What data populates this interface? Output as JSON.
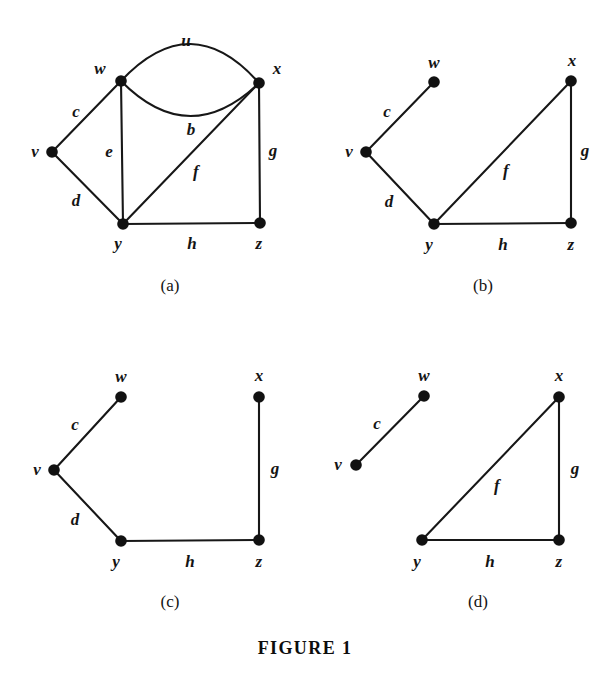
{
  "figure": {
    "caption": "FIGURE 1",
    "caption_pos": {
      "x": 305,
      "y": 648
    },
    "ink_color": "#141414",
    "background_color": "#ffffff"
  },
  "panels": [
    {
      "id": "panel-a",
      "label": "(a)",
      "label_pos": {
        "x": 170,
        "y": 286
      },
      "vertices": [
        {
          "id": "v",
          "label": "v",
          "x": 52,
          "y": 152,
          "label_x": 35,
          "label_y": 151
        },
        {
          "id": "w",
          "label": "w",
          "x": 121,
          "y": 81,
          "label_x": 100,
          "label_y": 68
        },
        {
          "id": "x",
          "label": "x",
          "x": 259,
          "y": 83,
          "label_x": 277,
          "label_y": 68
        },
        {
          "id": "y",
          "label": "y",
          "x": 123,
          "y": 224,
          "label_x": 118,
          "label_y": 243
        },
        {
          "id": "z",
          "label": "z",
          "x": 260,
          "y": 223,
          "label_x": 259,
          "label_y": 243
        }
      ],
      "edges": [
        {
          "id": "u",
          "label": "u",
          "from": "w",
          "to": "x",
          "shape": "arc",
          "bow": -38,
          "label_x": 186,
          "label_y": 40
        },
        {
          "id": "b",
          "label": "b",
          "from": "w",
          "to": "x",
          "shape": "arc",
          "bow": 34,
          "label_x": 191,
          "label_y": 129
        },
        {
          "id": "c",
          "label": "c",
          "from": "v",
          "to": "w",
          "shape": "line",
          "label_x": 76,
          "label_y": 111
        },
        {
          "id": "d",
          "label": "d",
          "from": "v",
          "to": "y",
          "shape": "line",
          "label_x": 76,
          "label_y": 200
        },
        {
          "id": "e",
          "label": "e",
          "from": "w",
          "to": "y",
          "shape": "line",
          "label_x": 109,
          "label_y": 151
        },
        {
          "id": "f",
          "label": "f",
          "from": "y",
          "to": "x",
          "shape": "line",
          "label_x": 196,
          "label_y": 171
        },
        {
          "id": "g",
          "label": "g",
          "from": "x",
          "to": "z",
          "shape": "line",
          "label_x": 273,
          "label_y": 150
        },
        {
          "id": "h",
          "label": "h",
          "from": "y",
          "to": "z",
          "shape": "line",
          "label_x": 192,
          "label_y": 243
        }
      ]
    },
    {
      "id": "panel-b",
      "label": "(b)",
      "label_pos": {
        "x": 483,
        "y": 286
      },
      "vertices": [
        {
          "id": "v",
          "label": "v",
          "x": 366,
          "y": 152,
          "label_x": 349,
          "label_y": 151
        },
        {
          "id": "w",
          "label": "w",
          "x": 434,
          "y": 82,
          "label_x": 434,
          "label_y": 62
        },
        {
          "id": "x",
          "label": "x",
          "x": 571,
          "y": 81,
          "label_x": 572,
          "label_y": 60
        },
        {
          "id": "y",
          "label": "y",
          "x": 434,
          "y": 224,
          "label_x": 429,
          "label_y": 244
        },
        {
          "id": "z",
          "label": "z",
          "x": 571,
          "y": 223,
          "label_x": 571,
          "label_y": 244
        }
      ],
      "edges": [
        {
          "id": "c",
          "label": "c",
          "from": "v",
          "to": "w",
          "shape": "line",
          "label_x": 387,
          "label_y": 111
        },
        {
          "id": "d",
          "label": "d",
          "from": "v",
          "to": "y",
          "shape": "line",
          "label_x": 389,
          "label_y": 201
        },
        {
          "id": "f",
          "label": "f",
          "from": "y",
          "to": "x",
          "shape": "line",
          "label_x": 506,
          "label_y": 170
        },
        {
          "id": "g",
          "label": "g",
          "from": "x",
          "to": "z",
          "shape": "line",
          "label_x": 585,
          "label_y": 150
        },
        {
          "id": "h",
          "label": "h",
          "from": "y",
          "to": "z",
          "shape": "line",
          "label_x": 503,
          "label_y": 244
        }
      ]
    },
    {
      "id": "panel-c",
      "label": "(c)",
      "label_pos": {
        "x": 170,
        "y": 602
      },
      "vertices": [
        {
          "id": "v",
          "label": "v",
          "x": 54,
          "y": 470,
          "label_x": 37,
          "label_y": 469
        },
        {
          "id": "w",
          "label": "w",
          "x": 121,
          "y": 397,
          "label_x": 121,
          "label_y": 376
        },
        {
          "id": "x",
          "label": "x",
          "x": 259,
          "y": 397,
          "label_x": 259,
          "label_y": 375
        },
        {
          "id": "y",
          "label": "y",
          "x": 121,
          "y": 541,
          "label_x": 116,
          "label_y": 561
        },
        {
          "id": "z",
          "label": "z",
          "x": 259,
          "y": 540,
          "label_x": 259,
          "label_y": 561
        }
      ],
      "edges": [
        {
          "id": "c",
          "label": "c",
          "from": "v",
          "to": "w",
          "shape": "line",
          "label_x": 75,
          "label_y": 424
        },
        {
          "id": "d",
          "label": "d",
          "from": "v",
          "to": "y",
          "shape": "line",
          "label_x": 75,
          "label_y": 519
        },
        {
          "id": "g",
          "label": "g",
          "from": "x",
          "to": "z",
          "shape": "line",
          "label_x": 275,
          "label_y": 468
        },
        {
          "id": "h",
          "label": "h",
          "from": "y",
          "to": "z",
          "shape": "line",
          "label_x": 190,
          "label_y": 561
        }
      ]
    },
    {
      "id": "panel-d",
      "label": "(d)",
      "label_pos": {
        "x": 478,
        "y": 602
      },
      "vertices": [
        {
          "id": "v",
          "label": "v",
          "x": 356,
          "y": 465,
          "label_x": 338,
          "label_y": 464
        },
        {
          "id": "w",
          "label": "w",
          "x": 424,
          "y": 396,
          "label_x": 424,
          "label_y": 375
        },
        {
          "id": "x",
          "label": "x",
          "x": 559,
          "y": 397,
          "label_x": 559,
          "label_y": 375
        },
        {
          "id": "y",
          "label": "y",
          "x": 422,
          "y": 540,
          "label_x": 417,
          "label_y": 561
        },
        {
          "id": "z",
          "label": "z",
          "x": 559,
          "y": 540,
          "label_x": 559,
          "label_y": 561
        }
      ],
      "edges": [
        {
          "id": "c",
          "label": "c",
          "from": "v",
          "to": "w",
          "shape": "line",
          "label_x": 377,
          "label_y": 423
        },
        {
          "id": "f",
          "label": "f",
          "from": "y",
          "to": "x",
          "shape": "line",
          "label_x": 497,
          "label_y": 485
        },
        {
          "id": "g",
          "label": "g",
          "from": "x",
          "to": "z",
          "shape": "line",
          "label_x": 575,
          "label_y": 468
        },
        {
          "id": "h",
          "label": "h",
          "from": "y",
          "to": "z",
          "shape": "line",
          "label_x": 490,
          "label_y": 561
        }
      ]
    }
  ],
  "chart_data": {
    "type": "diagram",
    "title": "FIGURE 1",
    "graphs": [
      {
        "panel": "(a)",
        "vertices": [
          "v",
          "w",
          "x",
          "y",
          "z"
        ],
        "edges": [
          {
            "name": "u",
            "endpoints": [
              "w",
              "x"
            ]
          },
          {
            "name": "b",
            "endpoints": [
              "w",
              "x"
            ]
          },
          {
            "name": "c",
            "endpoints": [
              "v",
              "w"
            ]
          },
          {
            "name": "d",
            "endpoints": [
              "v",
              "y"
            ]
          },
          {
            "name": "e",
            "endpoints": [
              "w",
              "y"
            ]
          },
          {
            "name": "f",
            "endpoints": [
              "y",
              "x"
            ]
          },
          {
            "name": "g",
            "endpoints": [
              "x",
              "z"
            ]
          },
          {
            "name": "h",
            "endpoints": [
              "y",
              "z"
            ]
          }
        ]
      },
      {
        "panel": "(b)",
        "vertices": [
          "v",
          "w",
          "x",
          "y",
          "z"
        ],
        "edges": [
          {
            "name": "c",
            "endpoints": [
              "v",
              "w"
            ]
          },
          {
            "name": "d",
            "endpoints": [
              "v",
              "y"
            ]
          },
          {
            "name": "f",
            "endpoints": [
              "y",
              "x"
            ]
          },
          {
            "name": "g",
            "endpoints": [
              "x",
              "z"
            ]
          },
          {
            "name": "h",
            "endpoints": [
              "y",
              "z"
            ]
          }
        ]
      },
      {
        "panel": "(c)",
        "vertices": [
          "v",
          "w",
          "x",
          "y",
          "z"
        ],
        "edges": [
          {
            "name": "c",
            "endpoints": [
              "v",
              "w"
            ]
          },
          {
            "name": "d",
            "endpoints": [
              "v",
              "y"
            ]
          },
          {
            "name": "g",
            "endpoints": [
              "x",
              "z"
            ]
          },
          {
            "name": "h",
            "endpoints": [
              "y",
              "z"
            ]
          }
        ]
      },
      {
        "panel": "(d)",
        "vertices": [
          "v",
          "w",
          "x",
          "y",
          "z"
        ],
        "edges": [
          {
            "name": "c",
            "endpoints": [
              "v",
              "w"
            ]
          },
          {
            "name": "f",
            "endpoints": [
              "y",
              "x"
            ]
          },
          {
            "name": "g",
            "endpoints": [
              "x",
              "z"
            ]
          },
          {
            "name": "h",
            "endpoints": [
              "y",
              "z"
            ]
          }
        ]
      }
    ]
  }
}
